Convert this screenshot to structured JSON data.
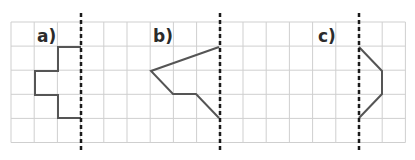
{
  "figure": {
    "grid": {
      "x0": 11,
      "y0": 22,
      "cols": 17,
      "rows": 5,
      "cell_w": 23.2,
      "cell_h": 24.1,
      "line_color": "#cfcfcf"
    },
    "axis_color": "#1a1a1a",
    "shape_color": "#555555",
    "panels": [
      {
        "id": "a",
        "label": "a)",
        "label_pos": {
          "x": 37,
          "y": 28
        },
        "axis_x": 81,
        "shape_points": [
          [
            81,
            47
          ],
          [
            58,
            47
          ],
          [
            58,
            71
          ],
          [
            35,
            71
          ],
          [
            35,
            95
          ],
          [
            58,
            95
          ],
          [
            58,
            118
          ],
          [
            81,
            118
          ]
        ]
      },
      {
        "id": "b",
        "label": "b)",
        "label_pos": {
          "x": 153,
          "y": 28
        },
        "axis_x": 220,
        "shape_points": [
          [
            219,
            47
          ],
          [
            151,
            71
          ],
          [
            173,
            94
          ],
          [
            196,
            94
          ],
          [
            219,
            118
          ]
        ]
      },
      {
        "id": "c",
        "label": "c)",
        "label_pos": {
          "x": 318,
          "y": 28
        },
        "axis_x": 359,
        "shape_points": [
          [
            359,
            47
          ],
          [
            382,
            71
          ],
          [
            382,
            94
          ],
          [
            359,
            118
          ]
        ]
      }
    ],
    "axis_y_range": [
      13,
      153
    ]
  }
}
